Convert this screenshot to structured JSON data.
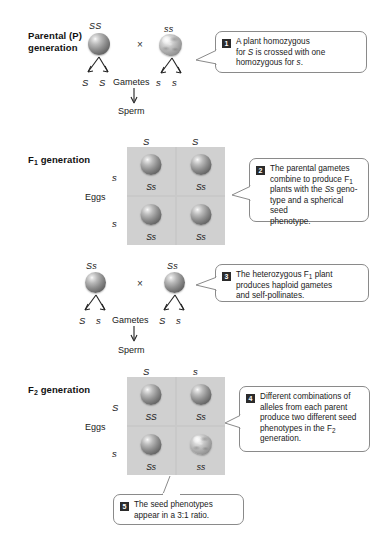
{
  "figure": {
    "labels": {
      "parental": "Parental (P)",
      "parental2": "generation",
      "f1": "F",
      "f1_sub": "1",
      "f1_rest": " generation",
      "f2": "F",
      "f2_sub": "2",
      "f2_rest": " generation",
      "gametes": "Gametes",
      "sperm": "Sperm",
      "eggs": "Eggs",
      "cross": "×"
    },
    "parental": {
      "left_genotype": "SS",
      "right_genotype": "ss",
      "left_gametes": [
        "S",
        "S"
      ],
      "right_gametes": [
        "s",
        "s"
      ],
      "left_seed": "spherical",
      "right_seed": "wrinkled"
    },
    "f1_square": {
      "sperm_headers": [
        "S",
        "S"
      ],
      "egg_headers": [
        "s",
        "s"
      ],
      "cells": [
        {
          "genotype": "Ss",
          "seed": "spherical"
        },
        {
          "genotype": "Ss",
          "seed": "spherical"
        },
        {
          "genotype": "Ss",
          "seed": "spherical"
        },
        {
          "genotype": "Ss",
          "seed": "spherical"
        }
      ]
    },
    "f1_cross": {
      "left_genotype": "Ss",
      "right_genotype": "Ss",
      "left_gametes": [
        "S",
        "s"
      ],
      "right_gametes": [
        "S",
        "s"
      ],
      "left_seed": "spherical",
      "right_seed": "spherical"
    },
    "f2_square": {
      "sperm_headers": [
        "S",
        "s"
      ],
      "egg_headers": [
        "S",
        "s"
      ],
      "cells": [
        {
          "genotype": "SS",
          "seed": "spherical"
        },
        {
          "genotype": "Ss",
          "seed": "spherical"
        },
        {
          "genotype": "Ss",
          "seed": "spherical"
        },
        {
          "genotype": "ss",
          "seed": "wrinkled"
        }
      ]
    },
    "callouts": [
      {
        "number": "1",
        "html": "A plant homozygous<br>for <i>S</i> is crossed with one<br>homozygous for <i>s</i>."
      },
      {
        "number": "2",
        "html": "The parental gametes<br>combine to produce F<sub>1</sub><br>plants with the <i>Ss</i> geno-<br>type and a spherical seed<br>phenotype."
      },
      {
        "number": "3",
        "html": "The heterozygous F<sub>1</sub> plant<br>produces haploid gametes<br>and self-pollinates."
      },
      {
        "number": "4",
        "html": "Different combinations of<br>alleles from each parent<br>produce two different seed<br>phenotypes in the F<sub>2</sub><br>generation."
      },
      {
        "number": "5",
        "html": "The seed phenotypes<br>appear in a 3:1 ratio."
      }
    ],
    "colors": {
      "square_bg": "#d0d0d0",
      "square_divider": "#ffffff",
      "callout_border": "#8a8a8a",
      "badge_bg": "#2b2b2b",
      "text": "#1a1a1a",
      "page_bg": "#ffffff"
    }
  }
}
